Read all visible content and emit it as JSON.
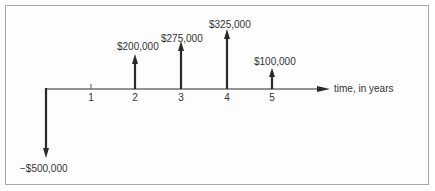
{
  "diagram": {
    "type": "cash-flow diagram",
    "axis_label": "time, in years",
    "tick_labels": [
      "1",
      "2",
      "3",
      "4",
      "5"
    ],
    "cash_flows": [
      {
        "year": 0,
        "amount": -500000,
        "label": "−$500,000",
        "direction": "down"
      },
      {
        "year": 2,
        "amount": 200000,
        "label": "$200,000",
        "direction": "up"
      },
      {
        "year": 3,
        "amount": 275000,
        "label": "$275,000",
        "direction": "up"
      },
      {
        "year": 4,
        "amount": 325000,
        "label": "$325,000",
        "direction": "up"
      },
      {
        "year": 5,
        "amount": 100000,
        "label": "$100,000",
        "direction": "up"
      }
    ],
    "colors": {
      "arrow": "#2a2a2a",
      "text": "#333333",
      "border": "#a8a8a8"
    }
  }
}
